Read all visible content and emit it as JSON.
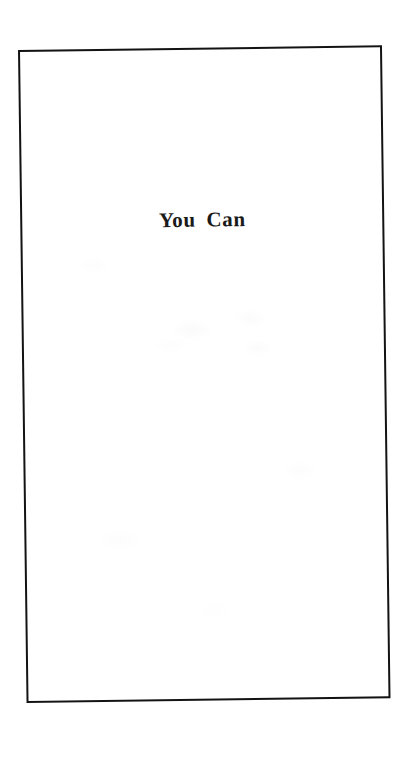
{
  "page": {
    "kind": "scanned-book-title-page",
    "background_color": "#ffffff",
    "ink_color": "#131313"
  },
  "frame": {
    "name": "printed-rule-border",
    "style": "single thin rectangular rule",
    "color": "#131313",
    "rotation_degrees": -0.75
  },
  "content": {
    "title": "You Can",
    "title_color": "#1a1a1a",
    "title_alignment": "center"
  }
}
